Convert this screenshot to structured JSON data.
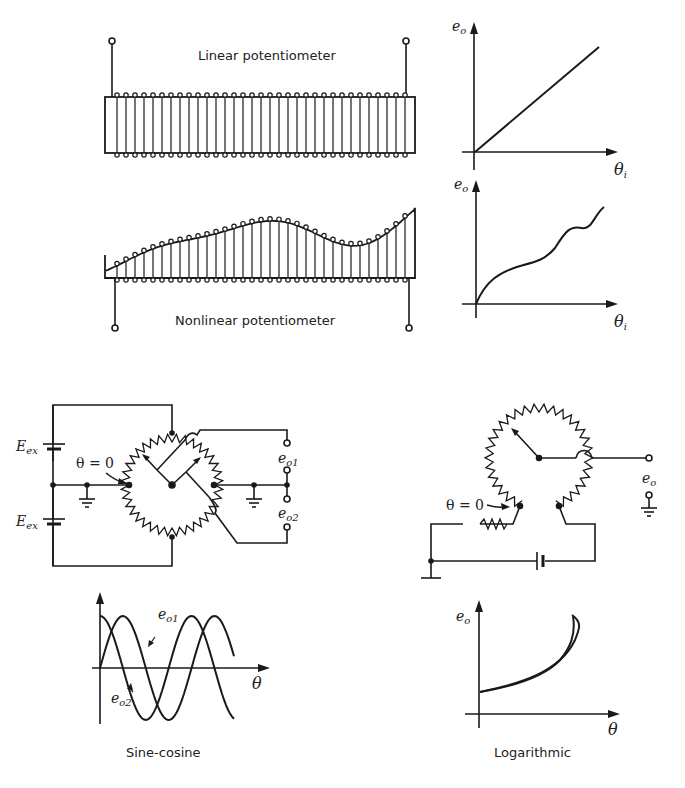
{
  "figure": {
    "linear_pot": {
      "caption": "Linear potentiometer"
    },
    "nonlinear_pot": {
      "caption": "Nonlinear potentiometer"
    },
    "linear_graph": {
      "y_label": "e",
      "y_sub": "o",
      "x_label": "θ",
      "x_sub": "i"
    },
    "nonlinear_graph": {
      "y_label": "e",
      "y_sub": "o",
      "x_label": "θ",
      "x_sub": "i"
    },
    "sine_cosine_circuit": {
      "source_top": "E",
      "source_top_sub": "ex",
      "source_bottom": "E",
      "source_bottom_sub": "ex",
      "zero_marker": "θ = 0",
      "output1": "e",
      "output1_sub": "o1",
      "output2": "e",
      "output2_sub": "o2"
    },
    "log_circuit": {
      "zero_marker": "θ = 0",
      "output": "e",
      "output_sub": "o"
    },
    "sine_cosine_graph": {
      "x_label": "θ",
      "curve1": "e",
      "curve1_sub": "o1",
      "curve2": "e",
      "curve2_sub": "o2",
      "caption": "Sine-cosine"
    },
    "log_graph": {
      "y_label": "e",
      "y_sub": "o",
      "x_label": "θ",
      "caption": "Logarithmic"
    }
  }
}
